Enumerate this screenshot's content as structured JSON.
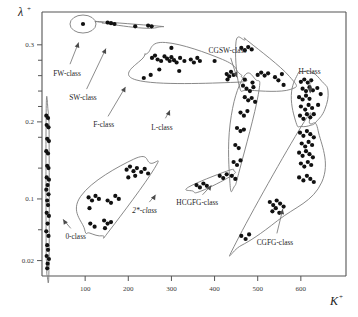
{
  "figure": {
    "background": "#ffffff",
    "point_color": "#111111",
    "hull_color": "#7c7c7c",
    "axis_color": "#555555"
  },
  "chart_data": {
    "type": "scatter",
    "title": "",
    "xlabel": "K",
    "xlabel_sup": "+",
    "ylabel": "λ",
    "ylabel_sup": "+",
    "xlim": [
      0,
      700
    ],
    "ylim": [
      0,
      0.34
    ],
    "grid": false,
    "legend_position": "none",
    "xticks": [
      100,
      200,
      300,
      400,
      500,
      600
    ],
    "xtick_labels": [
      "100",
      "200",
      "300",
      "400",
      "500",
      "600"
    ],
    "yticks": [
      0.02,
      0.1,
      0.2,
      0.3
    ],
    "ytick_labels": [
      "0.02",
      "0.1",
      "0.2",
      "0.3"
    ],
    "yminor": [
      0.06,
      0.14,
      0.18,
      0.22,
      0.24,
      0.26,
      0.28
    ],
    "annotations": [
      {
        "label": "FW-class",
        "text_x": 58,
        "text_y": 260,
        "arrow_to_x": 88,
        "arrow_to_y": 308
      },
      {
        "label": "SW-class",
        "text_x": 95,
        "text_y": 228,
        "arrow_to_x": 152,
        "arrow_to_y": 300
      },
      {
        "label": "F-class",
        "text_x": 143,
        "text_y": 193,
        "arrow_to_x": 198,
        "arrow_to_y": 250
      },
      {
        "label": "L-class",
        "text_x": 278,
        "text_y": 190,
        "arrow_to_x": 300,
        "arrow_to_y": 220
      },
      {
        "label": "CGSW-class",
        "text_x": 430,
        "text_y": 290,
        "arrow_to_x": 455,
        "arrow_to_y": 253
      },
      {
        "label": "H-class",
        "text_x": 620,
        "text_y": 262,
        "arrow_to_x": 622,
        "arrow_to_y": 232
      },
      {
        "label": "2*-class",
        "text_x": 238,
        "text_y": 82,
        "arrow_to_x": 268,
        "arrow_to_y": 110
      },
      {
        "label": "HCGFG-class",
        "text_x": 360,
        "text_y": 92,
        "arrow_to_x": 398,
        "arrow_to_y": 122
      },
      {
        "label": "0-class",
        "text_x": 78,
        "text_y": 48,
        "arrow_to_x": 44,
        "arrow_to_y": 78
      },
      {
        "label": "CGFG-class",
        "text_x": 540,
        "text_y": 40,
        "arrow_to_x": 560,
        "arrow_to_y": 92
      }
    ],
    "classes": [
      {
        "name": "0-class",
        "points": [
          [
            10,
            0.208
          ],
          [
            14,
            0.205
          ],
          [
            11,
            0.196
          ],
          [
            15,
            0.193
          ],
          [
            12,
            0.178
          ],
          [
            16,
            0.175
          ],
          [
            10,
            0.162
          ],
          [
            14,
            0.159
          ],
          [
            12,
            0.143
          ],
          [
            15,
            0.14
          ],
          [
            11,
            0.128
          ],
          [
            16,
            0.125
          ],
          [
            13,
            0.118
          ],
          [
            10,
            0.112
          ],
          [
            15,
            0.106
          ],
          [
            12,
            0.098
          ],
          [
            14,
            0.092
          ],
          [
            11,
            0.082
          ],
          [
            16,
            0.078
          ],
          [
            13,
            0.068
          ],
          [
            10,
            0.058
          ],
          [
            15,
            0.052
          ],
          [
            12,
            0.04
          ],
          [
            14,
            0.034
          ],
          [
            11,
            0.026
          ],
          [
            16,
            0.022
          ],
          [
            13,
            0.016
          ],
          [
            12,
            0.01
          ]
        ]
      },
      {
        "name": "FW-class",
        "points": [
          [
            95,
            0.327
          ]
        ]
      },
      {
        "name": "SW-class",
        "points": [
          [
            152,
            0.329
          ],
          [
            160,
            0.328
          ],
          [
            168,
            0.327
          ],
          [
            216,
            0.324
          ],
          [
            246,
            0.325
          ],
          [
            254,
            0.324
          ]
        ]
      },
      {
        "name": "F-class",
        "points": [
          [
            255,
            0.283
          ],
          [
            262,
            0.286
          ],
          [
            268,
            0.281
          ],
          [
            276,
            0.279
          ],
          [
            284,
            0.285
          ],
          [
            290,
            0.282
          ],
          [
            296,
            0.279
          ],
          [
            300,
            0.284
          ],
          [
            306,
            0.28
          ],
          [
            312,
            0.277
          ],
          [
            320,
            0.283
          ],
          [
            330,
            0.279
          ],
          [
            345,
            0.281
          ],
          [
            352,
            0.277
          ],
          [
            360,
            0.283
          ],
          [
            366,
            0.279
          ],
          [
            300,
            0.296
          ],
          [
            272,
            0.268
          ],
          [
            318,
            0.266
          ],
          [
            400,
            0.279
          ],
          [
            236,
            0.257
          ],
          [
            252,
            0.261
          ],
          [
            428,
            0.262
          ],
          [
            434,
            0.259
          ],
          [
            438,
            0.265
          ],
          [
            444,
            0.261
          ],
          [
            430,
            0.255
          ]
        ]
      },
      {
        "name": "CGSW-class",
        "points": [
          [
            462,
            0.296
          ],
          [
            470,
            0.293
          ],
          [
            478,
            0.297
          ],
          [
            486,
            0.294
          ],
          [
            500,
            0.261
          ],
          [
            508,
            0.264
          ],
          [
            516,
            0.26
          ],
          [
            524,
            0.263
          ],
          [
            540,
            0.258
          ],
          [
            548,
            0.254
          ],
          [
            556,
            0.262
          ],
          [
            470,
            0.255
          ],
          [
            488,
            0.251
          ],
          [
            560,
            0.248
          ]
        ]
      },
      {
        "name": "L-class",
        "points": [
          [
            466,
            0.247
          ],
          [
            474,
            0.243
          ],
          [
            482,
            0.24
          ],
          [
            490,
            0.245
          ],
          [
            470,
            0.232
          ],
          [
            478,
            0.228
          ],
          [
            486,
            0.231
          ],
          [
            494,
            0.226
          ],
          [
            460,
            0.212
          ],
          [
            468,
            0.208
          ],
          [
            476,
            0.214
          ],
          [
            452,
            0.192
          ],
          [
            460,
            0.188
          ],
          [
            468,
            0.19
          ],
          [
            448,
            0.17
          ],
          [
            456,
            0.166
          ],
          [
            444,
            0.148
          ],
          [
            452,
            0.144
          ],
          [
            460,
            0.15
          ],
          [
            440,
            0.13
          ],
          [
            448,
            0.126
          ]
        ]
      },
      {
        "name": "H-class",
        "points": [
          [
            600,
            0.252
          ],
          [
            608,
            0.255
          ],
          [
            616,
            0.251
          ],
          [
            624,
            0.254
          ],
          [
            604,
            0.243
          ],
          [
            612,
            0.24
          ],
          [
            620,
            0.245
          ],
          [
            628,
            0.241
          ],
          [
            596,
            0.232
          ],
          [
            604,
            0.229
          ],
          [
            612,
            0.234
          ],
          [
            620,
            0.23
          ],
          [
            600,
            0.22
          ],
          [
            610,
            0.216
          ],
          [
            618,
            0.222
          ],
          [
            626,
            0.218
          ],
          [
            598,
            0.208
          ],
          [
            606,
            0.204
          ],
          [
            614,
            0.21
          ],
          [
            622,
            0.206
          ],
          [
            630,
            0.21
          ],
          [
            640,
            0.222
          ],
          [
            646,
            0.236
          ],
          [
            638,
            0.244
          ]
        ]
      },
      {
        "name": "CGFG-class",
        "points": [
          [
            598,
            0.186
          ],
          [
            606,
            0.182
          ],
          [
            614,
            0.188
          ],
          [
            622,
            0.184
          ],
          [
            630,
            0.18
          ],
          [
            602,
            0.172
          ],
          [
            610,
            0.168
          ],
          [
            618,
            0.174
          ],
          [
            626,
            0.17
          ],
          [
            596,
            0.16
          ],
          [
            604,
            0.156
          ],
          [
            612,
            0.162
          ],
          [
            620,
            0.158
          ],
          [
            628,
            0.154
          ],
          [
            600,
            0.146
          ],
          [
            608,
            0.142
          ],
          [
            616,
            0.148
          ],
          [
            624,
            0.144
          ],
          [
            596,
            0.128
          ],
          [
            606,
            0.124
          ],
          [
            614,
            0.13
          ],
          [
            622,
            0.126
          ],
          [
            630,
            0.122
          ],
          [
            528,
            0.096
          ],
          [
            536,
            0.092
          ],
          [
            544,
            0.098
          ],
          [
            552,
            0.094
          ],
          [
            560,
            0.09
          ],
          [
            534,
            0.084
          ],
          [
            542,
            0.088
          ],
          [
            550,
            0.082
          ],
          [
            462,
            0.052
          ],
          [
            472,
            0.048
          ],
          [
            480,
            0.054
          ]
        ]
      },
      {
        "name": "HCGFG-class",
        "points": [
          [
            358,
            0.118
          ],
          [
            366,
            0.115
          ],
          [
            374,
            0.12
          ],
          [
            382,
            0.117
          ],
          [
            412,
            0.13
          ],
          [
            420,
            0.127
          ],
          [
            428,
            0.132
          ]
        ]
      },
      {
        "name": "2*-class",
        "points": [
          [
            108,
            0.102
          ],
          [
            116,
            0.098
          ],
          [
            124,
            0.104
          ],
          [
            132,
            0.1
          ],
          [
            110,
            0.088
          ],
          [
            152,
            0.098
          ],
          [
            160,
            0.095
          ],
          [
            112,
            0.068
          ],
          [
            122,
            0.064
          ],
          [
            144,
            0.072
          ],
          [
            152,
            0.068
          ],
          [
            160,
            0.07
          ],
          [
            146,
            0.062
          ],
          [
            170,
            0.104
          ],
          [
            178,
            0.1
          ],
          [
            196,
            0.138
          ],
          [
            204,
            0.142
          ],
          [
            212,
            0.136
          ],
          [
            220,
            0.14
          ],
          [
            230,
            0.135
          ],
          [
            238,
            0.139
          ],
          [
            200,
            0.128
          ],
          [
            216,
            0.13
          ],
          [
            246,
            0.133
          ]
        ]
      }
    ]
  }
}
